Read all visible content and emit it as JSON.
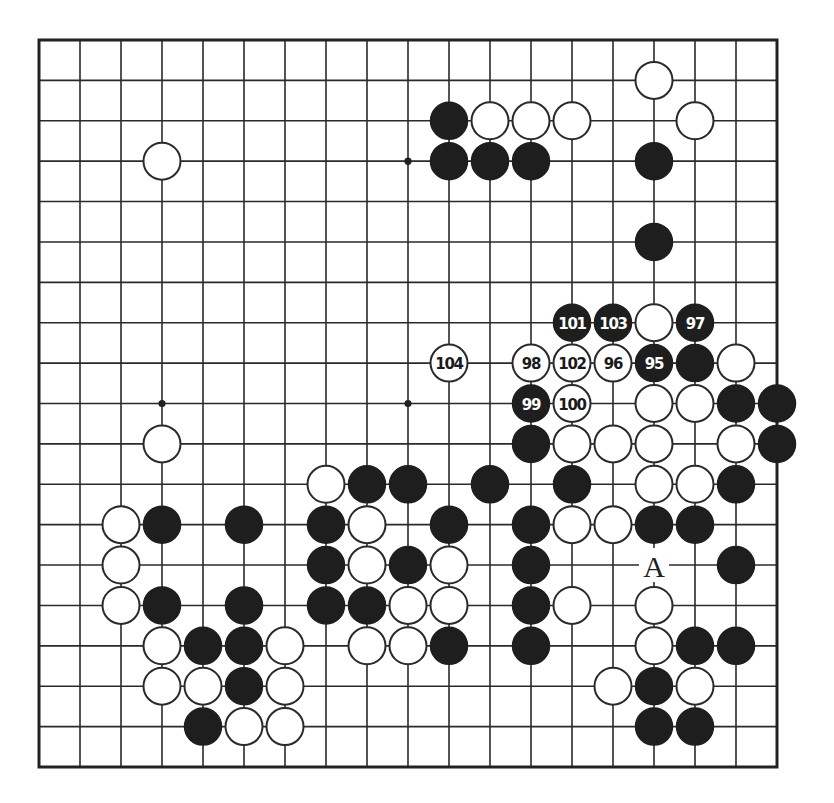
{
  "diagram": {
    "type": "go-board",
    "size": 19,
    "colors": {
      "black": "#1e1e1e",
      "white": "#ffffff",
      "line": "#2a2a2a",
      "background": "#ffffff"
    },
    "star_points": [
      [
        3,
        3
      ],
      [
        9,
        3
      ],
      [
        15,
        3
      ],
      [
        3,
        9
      ],
      [
        9,
        9
      ],
      [
        15,
        9
      ],
      [
        3,
        15
      ],
      [
        9,
        15
      ],
      [
        15,
        15
      ]
    ],
    "visible_star_points": [
      [
        9,
        3
      ],
      [
        3,
        9
      ],
      [
        9,
        9
      ]
    ],
    "stones": [
      {
        "c": 15,
        "r": 1,
        "color": "white"
      },
      {
        "c": 10,
        "r": 2,
        "color": "black"
      },
      {
        "c": 11,
        "r": 2,
        "color": "white"
      },
      {
        "c": 12,
        "r": 2,
        "color": "white"
      },
      {
        "c": 13,
        "r": 2,
        "color": "white"
      },
      {
        "c": 16,
        "r": 2,
        "color": "white"
      },
      {
        "c": 3,
        "r": 3,
        "color": "white"
      },
      {
        "c": 10,
        "r": 3,
        "color": "black"
      },
      {
        "c": 11,
        "r": 3,
        "color": "black"
      },
      {
        "c": 12,
        "r": 3,
        "color": "black"
      },
      {
        "c": 15,
        "r": 3,
        "color": "black"
      },
      {
        "c": 15,
        "r": 5,
        "color": "black"
      },
      {
        "c": 13,
        "r": 7,
        "color": "black",
        "label": "101"
      },
      {
        "c": 14,
        "r": 7,
        "color": "black",
        "label": "103"
      },
      {
        "c": 15,
        "r": 7,
        "color": "white"
      },
      {
        "c": 16,
        "r": 7,
        "color": "black",
        "label": "97"
      },
      {
        "c": 10,
        "r": 8,
        "color": "white",
        "label": "104"
      },
      {
        "c": 12,
        "r": 8,
        "color": "white",
        "label": "98"
      },
      {
        "c": 13,
        "r": 8,
        "color": "white",
        "label": "102"
      },
      {
        "c": 14,
        "r": 8,
        "color": "white",
        "label": "96"
      },
      {
        "c": 15,
        "r": 8,
        "color": "black",
        "label": "95"
      },
      {
        "c": 16,
        "r": 8,
        "color": "black"
      },
      {
        "c": 17,
        "r": 8,
        "color": "white"
      },
      {
        "c": 12,
        "r": 9,
        "color": "black",
        "label": "99"
      },
      {
        "c": 13,
        "r": 9,
        "color": "white",
        "label": "100"
      },
      {
        "c": 15,
        "r": 9,
        "color": "white"
      },
      {
        "c": 16,
        "r": 9,
        "color": "white"
      },
      {
        "c": 17,
        "r": 9,
        "color": "black"
      },
      {
        "c": 18,
        "r": 9,
        "color": "black"
      },
      {
        "c": 3,
        "r": 10,
        "color": "white"
      },
      {
        "c": 12,
        "r": 10,
        "color": "black"
      },
      {
        "c": 13,
        "r": 10,
        "color": "white"
      },
      {
        "c": 14,
        "r": 10,
        "color": "white"
      },
      {
        "c": 15,
        "r": 10,
        "color": "white"
      },
      {
        "c": 17,
        "r": 10,
        "color": "white"
      },
      {
        "c": 18,
        "r": 10,
        "color": "black"
      },
      {
        "c": 7,
        "r": 11,
        "color": "white"
      },
      {
        "c": 8,
        "r": 11,
        "color": "black"
      },
      {
        "c": 9,
        "r": 11,
        "color": "black"
      },
      {
        "c": 11,
        "r": 11,
        "color": "black"
      },
      {
        "c": 13,
        "r": 11,
        "color": "black"
      },
      {
        "c": 15,
        "r": 11,
        "color": "white"
      },
      {
        "c": 16,
        "r": 11,
        "color": "white"
      },
      {
        "c": 17,
        "r": 11,
        "color": "black"
      },
      {
        "c": 2,
        "r": 12,
        "color": "white"
      },
      {
        "c": 3,
        "r": 12,
        "color": "black"
      },
      {
        "c": 5,
        "r": 12,
        "color": "black"
      },
      {
        "c": 7,
        "r": 12,
        "color": "black"
      },
      {
        "c": 8,
        "r": 12,
        "color": "white"
      },
      {
        "c": 10,
        "r": 12,
        "color": "black"
      },
      {
        "c": 12,
        "r": 12,
        "color": "black"
      },
      {
        "c": 13,
        "r": 12,
        "color": "white"
      },
      {
        "c": 14,
        "r": 12,
        "color": "white"
      },
      {
        "c": 15,
        "r": 12,
        "color": "black"
      },
      {
        "c": 16,
        "r": 12,
        "color": "black"
      },
      {
        "c": 2,
        "r": 13,
        "color": "white"
      },
      {
        "c": 7,
        "r": 13,
        "color": "black"
      },
      {
        "c": 8,
        "r": 13,
        "color": "white"
      },
      {
        "c": 9,
        "r": 13,
        "color": "black"
      },
      {
        "c": 10,
        "r": 13,
        "color": "white"
      },
      {
        "c": 12,
        "r": 13,
        "color": "black"
      },
      {
        "c": 17,
        "r": 13,
        "color": "black"
      },
      {
        "c": 2,
        "r": 14,
        "color": "white"
      },
      {
        "c": 3,
        "r": 14,
        "color": "black"
      },
      {
        "c": 5,
        "r": 14,
        "color": "black"
      },
      {
        "c": 7,
        "r": 14,
        "color": "black"
      },
      {
        "c": 8,
        "r": 14,
        "color": "black"
      },
      {
        "c": 9,
        "r": 14,
        "color": "white"
      },
      {
        "c": 10,
        "r": 14,
        "color": "white"
      },
      {
        "c": 12,
        "r": 14,
        "color": "black"
      },
      {
        "c": 13,
        "r": 14,
        "color": "white"
      },
      {
        "c": 15,
        "r": 14,
        "color": "white"
      },
      {
        "c": 3,
        "r": 15,
        "color": "white"
      },
      {
        "c": 4,
        "r": 15,
        "color": "black"
      },
      {
        "c": 5,
        "r": 15,
        "color": "black"
      },
      {
        "c": 6,
        "r": 15,
        "color": "white"
      },
      {
        "c": 8,
        "r": 15,
        "color": "white"
      },
      {
        "c": 9,
        "r": 15,
        "color": "white"
      },
      {
        "c": 10,
        "r": 15,
        "color": "black"
      },
      {
        "c": 12,
        "r": 15,
        "color": "black"
      },
      {
        "c": 15,
        "r": 15,
        "color": "white"
      },
      {
        "c": 16,
        "r": 15,
        "color": "black"
      },
      {
        "c": 17,
        "r": 15,
        "color": "black"
      },
      {
        "c": 3,
        "r": 16,
        "color": "white"
      },
      {
        "c": 4,
        "r": 16,
        "color": "white"
      },
      {
        "c": 5,
        "r": 16,
        "color": "black"
      },
      {
        "c": 6,
        "r": 16,
        "color": "white"
      },
      {
        "c": 14,
        "r": 16,
        "color": "white"
      },
      {
        "c": 15,
        "r": 16,
        "color": "black"
      },
      {
        "c": 16,
        "r": 16,
        "color": "white"
      },
      {
        "c": 4,
        "r": 17,
        "color": "black"
      },
      {
        "c": 5,
        "r": 17,
        "color": "white"
      },
      {
        "c": 6,
        "r": 17,
        "color": "white"
      },
      {
        "c": 15,
        "r": 17,
        "color": "black"
      },
      {
        "c": 16,
        "r": 17,
        "color": "black"
      }
    ],
    "point_labels": [
      {
        "c": 15,
        "r": 13,
        "text": "A"
      }
    ],
    "move_sequence": [
      "95",
      "96",
      "97",
      "98",
      "99",
      "100",
      "101",
      "102",
      "103",
      "104"
    ]
  }
}
